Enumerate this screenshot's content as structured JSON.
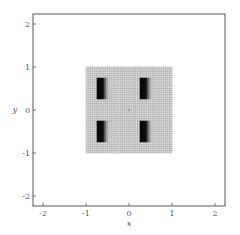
{
  "chart_data": {
    "type": "heatmap",
    "title": "",
    "xlabel": "x",
    "ylabel": "y",
    "xlim": [
      -2.3,
      2.2
    ],
    "ylim": [
      -2.25,
      2.25
    ],
    "xticks": [
      -2,
      -1,
      0,
      1,
      2
    ],
    "yticks": [
      -2,
      -1,
      0,
      1,
      2
    ],
    "xtick_labels": [
      "-2",
      "-1",
      "0",
      "1",
      "2"
    ],
    "ytick_labels": [
      "-2",
      "-1",
      "0",
      "1",
      "2"
    ],
    "grid": {
      "x_range": [
        -1,
        1
      ],
      "y_range": [
        -1,
        1
      ],
      "cells_per_side": 40,
      "line_color": "#9a9a9a",
      "background": "#e6e6e6"
    },
    "dark_regions": [
      {
        "name": "top-left",
        "x": [
          -0.75,
          -0.45
        ],
        "y": [
          0.25,
          0.75
        ]
      },
      {
        "name": "top-right",
        "x": [
          0.25,
          0.55
        ],
        "y": [
          0.25,
          0.75
        ]
      },
      {
        "name": "bottom-left",
        "x": [
          -0.75,
          -0.45
        ],
        "y": [
          -0.75,
          -0.25
        ]
      },
      {
        "name": "bottom-right",
        "x": [
          0.25,
          0.55
        ],
        "y": [
          -0.75,
          -0.25
        ]
      }
    ],
    "region_fill": "gradient black to grey (left to right)",
    "legend": null
  },
  "axes": {
    "xlabel": "x",
    "ylabel": "y"
  }
}
